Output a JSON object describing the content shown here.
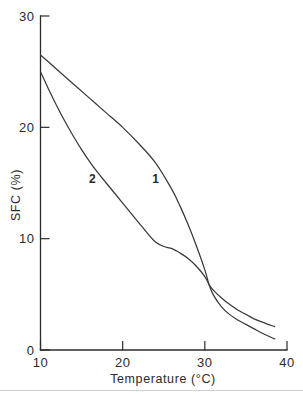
{
  "chart_data": {
    "type": "line",
    "title": "",
    "subtitle": "",
    "xlabel": "Temperature (°C)",
    "ylabel": "SFC (%)",
    "xlim": [
      10,
      40
    ],
    "ylim": [
      0,
      30
    ],
    "xticks": [
      10,
      20,
      30,
      40
    ],
    "yticks": [
      0,
      10,
      20,
      30
    ],
    "xtick_labels": [
      "10",
      "20",
      "30",
      "40"
    ],
    "ytick_labels": [
      "0",
      "10",
      "20",
      "30"
    ],
    "grid": false,
    "legend_position": "inline-curve-labels",
    "annotations": [
      {
        "text": "1",
        "x": 24.0,
        "y": 15.0
      },
      {
        "text": "2",
        "x": 16.3,
        "y": 15.0
      }
    ],
    "series": [
      {
        "name": "1",
        "label": "1",
        "color": "#3a3a3a",
        "x": [
          10.0,
          12.0,
          14.0,
          16.0,
          18.0,
          20.0,
          22.0,
          24.0,
          26.0,
          27.0,
          28.0,
          29.0,
          30.0,
          30.5,
          31.0,
          32.0,
          33.0,
          34.0,
          35.0,
          36.0,
          37.0,
          38.5
        ],
        "y": [
          26.5,
          25.2,
          23.9,
          22.6,
          21.3,
          20.0,
          18.5,
          16.8,
          14.4,
          12.9,
          11.2,
          9.3,
          7.2,
          5.9,
          5.0,
          3.9,
          3.2,
          2.7,
          2.3,
          1.9,
          1.5,
          1.0
        ]
      },
      {
        "name": "2",
        "label": "2",
        "color": "#3a3a3a",
        "x": [
          10.0,
          11.0,
          12.0,
          13.0,
          14.0,
          15.0,
          16.0,
          17.0,
          18.0,
          19.0,
          20.0,
          21.0,
          22.0,
          23.0,
          24.0,
          25.0,
          26.0,
          27.0,
          28.0,
          29.0,
          30.0,
          30.5,
          31.0,
          32.0,
          33.0,
          34.0,
          35.0,
          36.0,
          37.0,
          38.5
        ],
        "y": [
          25.0,
          23.4,
          21.9,
          20.5,
          19.2,
          18.0,
          16.9,
          15.9,
          15.0,
          14.1,
          13.2,
          12.3,
          11.4,
          10.5,
          9.7,
          9.3,
          9.1,
          8.7,
          8.2,
          7.5,
          6.6,
          5.9,
          5.4,
          4.7,
          4.1,
          3.6,
          3.2,
          2.8,
          2.5,
          2.1
        ]
      }
    ]
  },
  "figure": {
    "background_color": "#ffffff",
    "axis_color": "#2b2b2b",
    "curve_color": "#3a3a3a"
  }
}
